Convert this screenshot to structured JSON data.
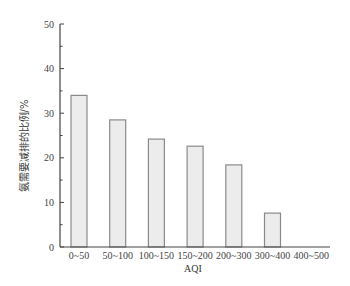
{
  "chart_data": {
    "type": "bar",
    "title": "",
    "xlabel": "AQI",
    "ylabel": "氨需要减排的比例/%",
    "categories": [
      "0~50",
      "50~100",
      "100~150",
      "150~200",
      "200~300",
      "300~400",
      "400~500"
    ],
    "values": [
      34.0,
      28.5,
      24.2,
      22.6,
      18.4,
      7.6,
      0
    ],
    "ylim": [
      0,
      50
    ],
    "yticks": [
      0,
      10,
      20,
      30,
      40,
      50
    ],
    "grid": false,
    "legend": null,
    "bar_fill": "#ececec",
    "bar_stroke": "#8a8a8a",
    "axis_color": "#444444"
  }
}
